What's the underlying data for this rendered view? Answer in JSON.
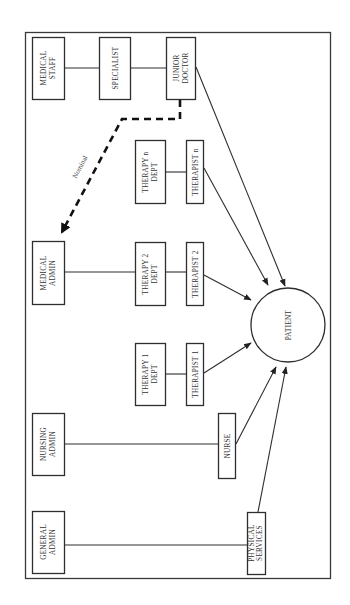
{
  "diagram": {
    "orientation": "rotated-90-ccw",
    "nodes": {
      "medical_staff": {
        "line1": "MEDICAL",
        "line2": "STAFF"
      },
      "specialist": {
        "line1": "SPECIALIST"
      },
      "junior_doctor": {
        "line1": "JUNIOR",
        "line2": "DOCTOR"
      },
      "medical_admin": {
        "line1": "MEDICAL",
        "line2": "ADMIN"
      },
      "therapy_n_dept": {
        "line1": "THERAPY n",
        "line2": "DEPT"
      },
      "therapist_n": {
        "line1": "THERAPIST n"
      },
      "therapy_2_dept": {
        "line1": "THERAPY 2",
        "line2": "DEPT"
      },
      "therapist_2": {
        "line1": "THERAPIST 2"
      },
      "therapy_1_dept": {
        "line1": "THERAPY 1",
        "line2": "DEPT"
      },
      "therapist_1": {
        "line1": "THERAPIST 1"
      },
      "nursing_admin": {
        "line1": "NURSING",
        "line2": "ADMIN"
      },
      "nurse": {
        "line1": "NURSE"
      },
      "general_admin": {
        "line1": "GENERAL",
        "line2": "ADMIN"
      },
      "physical_services": {
        "line1": "PHYSICAL",
        "line2": "SERVICES"
      },
      "patient": {
        "line1": "PATIENT"
      }
    },
    "edges": [
      {
        "from": "medical_staff",
        "to": "specialist",
        "type": "line"
      },
      {
        "from": "specialist",
        "to": "junior_doctor",
        "type": "line"
      },
      {
        "from": "junior_doctor",
        "to": "medical_admin",
        "type": "dashed-arrow",
        "label": "Nominal"
      },
      {
        "from": "medical_admin",
        "to": "therapy_2_dept",
        "type": "line"
      },
      {
        "from": "therapy_n_dept",
        "to": "therapist_n",
        "type": "line"
      },
      {
        "from": "therapy_2_dept",
        "to": "therapist_2",
        "type": "line"
      },
      {
        "from": "therapy_1_dept",
        "to": "therapist_1",
        "type": "line"
      },
      {
        "from": "nursing_admin",
        "to": "nurse",
        "type": "line"
      },
      {
        "from": "general_admin",
        "to": "physical_services",
        "type": "line"
      },
      {
        "from": "junior_doctor",
        "to": "patient",
        "type": "arrow"
      },
      {
        "from": "therapist_n",
        "to": "patient",
        "type": "arrow"
      },
      {
        "from": "therapist_2",
        "to": "patient",
        "type": "arrow"
      },
      {
        "from": "therapist_1",
        "to": "patient",
        "type": "arrow"
      },
      {
        "from": "nurse",
        "to": "patient",
        "type": "arrow"
      },
      {
        "from": "physical_services",
        "to": "patient",
        "type": "arrow"
      }
    ],
    "nominal_label": "Nominal"
  }
}
